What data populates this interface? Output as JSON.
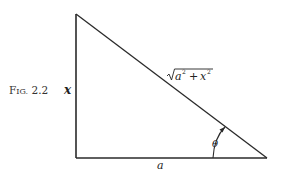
{
  "figure": {
    "label_prefix": "F",
    "label_smallcaps": "IG.",
    "label_number": " 2.2",
    "caption_full": "Fig. 2.2"
  },
  "triangle": {
    "vertical_side_label": "x",
    "horizontal_side_label": "a",
    "hypotenuse_label": {
      "radicand_a": "a",
      "exp_a": "2",
      "plus": "+",
      "radicand_x": "x",
      "exp_x": "2",
      "full": "√(a² + x²)"
    },
    "angle_label": "θ",
    "right_angle_at": "bottom-left",
    "angle_at": "bottom-right"
  },
  "colors": {
    "line": "#2a2a2a",
    "text": "#222222",
    "background": "#ffffff"
  }
}
